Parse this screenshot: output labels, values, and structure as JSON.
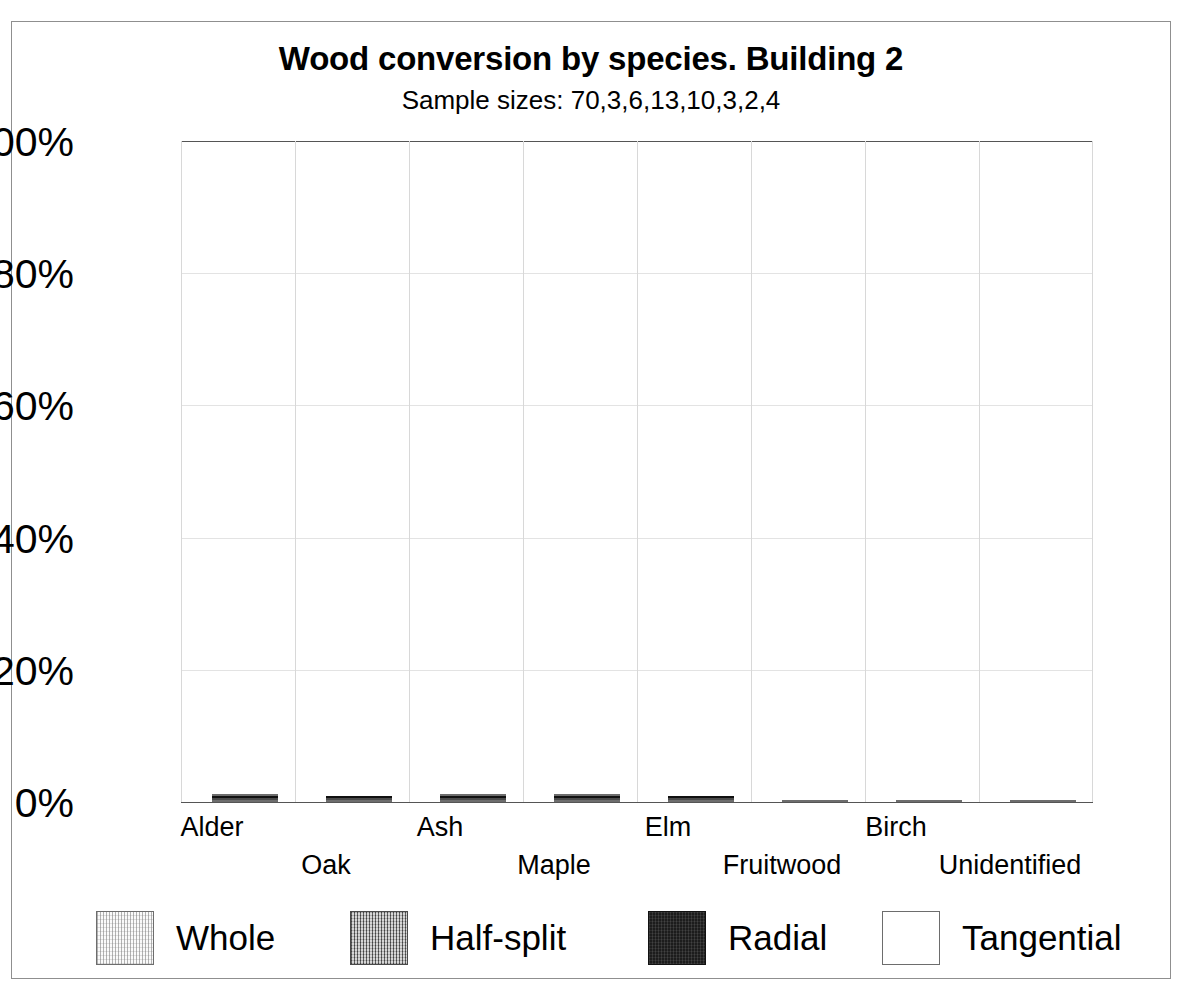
{
  "chart_data": {
    "type": "bar",
    "subtype": "stacked-100-percent",
    "title": "Wood conversion by species. Building 2",
    "subtitle": "Sample sizes: 70,3,6,13,10,3,2,4",
    "xlabel": "",
    "ylabel": "",
    "ylim": [
      0,
      100
    ],
    "yticks": [
      "0%",
      "20%",
      "40%",
      "60%",
      "80%",
      "100%"
    ],
    "ytick_values": [
      0,
      20,
      40,
      60,
      80,
      100
    ],
    "grid": true,
    "legend_position": "bottom",
    "categories": [
      "Alder",
      "Oak",
      "Ash",
      "Maple",
      "Elm",
      "Fruitwood",
      "Birch",
      "Unidentified"
    ],
    "sample_sizes": [
      70,
      3,
      6,
      13,
      10,
      3,
      2,
      4
    ],
    "series": [
      {
        "name": "Whole",
        "color": "#fafafa",
        "values": [
          84.3,
          33.3,
          16.7,
          15.4,
          20.0,
          100.0,
          100.0,
          100.0
        ]
      },
      {
        "name": "Half-split",
        "color": "#9c9c9c",
        "values": [
          7.1,
          33.3,
          16.7,
          30.8,
          30.0,
          0.0,
          0.0,
          0.0
        ]
      },
      {
        "name": "Radial",
        "color": "#1c1c1c",
        "values": [
          5.7,
          33.3,
          16.7,
          38.5,
          50.0,
          0.0,
          0.0,
          0.0
        ]
      },
      {
        "name": "Tangential",
        "color": "#ffffff",
        "values": [
          2.9,
          0.0,
          50.0,
          15.4,
          0.0,
          0.0,
          0.0,
          0.0
        ]
      }
    ]
  },
  "legend": {
    "items": [
      {
        "label": "Whole"
      },
      {
        "label": "Half-split"
      },
      {
        "label": "Radial"
      },
      {
        "label": "Tangential"
      }
    ]
  }
}
